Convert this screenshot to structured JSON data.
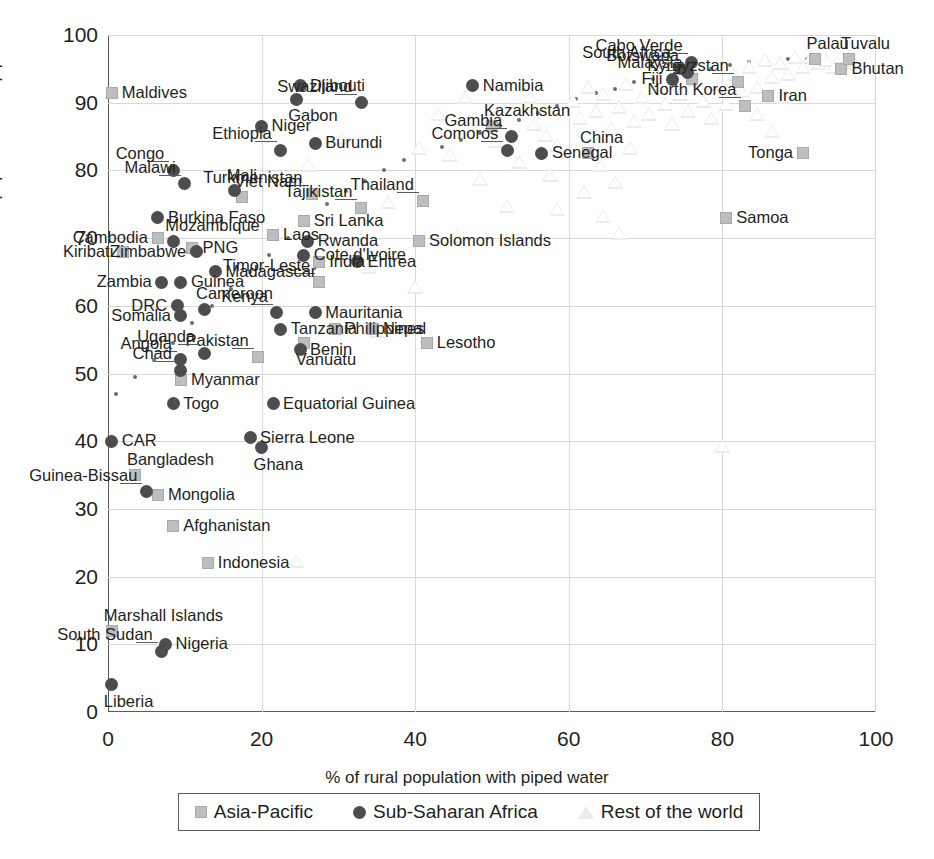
{
  "chart_data": {
    "type": "scatter",
    "title": "",
    "xlabel": "% of rural population with piped water",
    "ylabel": "% of urban population with piped water",
    "xlim": [
      0,
      100
    ],
    "ylim": [
      0,
      100
    ],
    "xticks": [
      0,
      20,
      40,
      60,
      80,
      100
    ],
    "yticks": [
      0,
      10,
      20,
      30,
      40,
      50,
      60,
      70,
      80,
      90,
      100
    ],
    "grid": true,
    "legend_position": "bottom",
    "legend": [
      {
        "label": "Asia-Pacific",
        "marker": "square",
        "color": "#bcbec0"
      },
      {
        "label": "Sub-Saharan Africa",
        "marker": "circle",
        "color": "#4d4d4f"
      },
      {
        "label": "Rest of the world",
        "marker": "triangle",
        "color": "#ececec"
      }
    ],
    "series": [
      {
        "name": "Asia-Pacific",
        "marker": "square",
        "points": [
          {
            "label": "Maldives",
            "x": 0.5,
            "y": 91.5,
            "label_pos": "right"
          },
          {
            "label": "Kiribati",
            "x": 2.0,
            "y": 68.0,
            "label_pos": "left"
          },
          {
            "label": "Cambodia",
            "x": 6.5,
            "y": 70.0,
            "label_pos": "left"
          },
          {
            "label": "PNG",
            "x": 11.0,
            "y": 68.5,
            "label_pos": "right"
          },
          {
            "label": "Viet Nam",
            "x": 17.5,
            "y": 76.0,
            "label_pos": "above"
          },
          {
            "label": "Laos",
            "x": 21.5,
            "y": 70.5,
            "label_pos": "right"
          },
          {
            "label": "Sri Lanka",
            "x": 25.5,
            "y": 72.5,
            "label_pos": "right"
          },
          {
            "label": "Turkmenistan",
            "x": 26.5,
            "y": 76.5,
            "label_pos": "leader"
          },
          {
            "label": "India",
            "x": 27.5,
            "y": 66.5,
            "label_pos": "right"
          },
          {
            "label": "Timor-Leste",
            "x": 27.5,
            "y": 63.5,
            "label_pos": "leader"
          },
          {
            "label": "Tajikistan",
            "x": 33.0,
            "y": 74.5,
            "label_pos": "leader"
          },
          {
            "label": "Philippines",
            "x": 29.5,
            "y": 56.5,
            "label_pos": "right"
          },
          {
            "label": "Myanmar",
            "x": 9.5,
            "y": 49.0,
            "label_pos": "right"
          },
          {
            "label": "Pakistan",
            "x": 19.5,
            "y": 52.5,
            "label_pos": "leader"
          },
          {
            "label": "Vanuatu",
            "x": 25.5,
            "y": 54.5,
            "label_pos": "below"
          },
          {
            "label": "Nepal",
            "x": 34.5,
            "y": 56.5,
            "label_pos": "right"
          },
          {
            "label": "Solomon Islands",
            "x": 40.5,
            "y": 69.5,
            "label_pos": "right"
          },
          {
            "label": "Thailand",
            "x": 41.0,
            "y": 75.5,
            "label_pos": "leader"
          },
          {
            "label": "Lesotho",
            "x": 41.5,
            "y": 54.5,
            "label_pos": "right"
          },
          {
            "label": "Kazakhstan",
            "x": 50.0,
            "y": 86.5,
            "label_pos": "above"
          },
          {
            "label": "China",
            "x": 62.5,
            "y": 82.5,
            "label_pos": "above"
          },
          {
            "label": "Malaysia",
            "x": 76.0,
            "y": 93.5,
            "label_pos": "leader"
          },
          {
            "label": "Kyrgyzstan",
            "x": 82.0,
            "y": 93.0,
            "label_pos": "leader"
          },
          {
            "label": "North Korea",
            "x": 83.0,
            "y": 89.5,
            "label_pos": "leader"
          },
          {
            "label": "Iran",
            "x": 86.0,
            "y": 91.0,
            "label_pos": "right"
          },
          {
            "label": "Tonga",
            "x": 90.5,
            "y": 82.5,
            "label_pos": "left"
          },
          {
            "label": "Samoa",
            "x": 80.5,
            "y": 73.0,
            "label_pos": "right"
          },
          {
            "label": "Bangladesh",
            "x": 3.5,
            "y": 35.0,
            "label_pos": "above"
          },
          {
            "label": "Mongolia",
            "x": 6.5,
            "y": 32.0,
            "label_pos": "right"
          },
          {
            "label": "Afghanistan",
            "x": 8.5,
            "y": 27.5,
            "label_pos": "right"
          },
          {
            "label": "Indonesia",
            "x": 13.0,
            "y": 22.0,
            "label_pos": "right"
          },
          {
            "label": "Marshall Islands",
            "x": 0.5,
            "y": 12.0,
            "label_pos": "above"
          },
          {
            "label": "Bhutan",
            "x": 95.5,
            "y": 95.0,
            "label_pos": "right"
          },
          {
            "label": "Palau",
            "x": 92.0,
            "y": 96.5,
            "label_pos": "above"
          },
          {
            "label": "Tuvalu",
            "x": 96.5,
            "y": 96.5,
            "label_pos": "above"
          }
        ]
      },
      {
        "name": "Sub-Saharan Africa",
        "marker": "circle",
        "points": [
          {
            "label": "Djibouti",
            "x": 25.0,
            "y": 92.5,
            "label_pos": "right"
          },
          {
            "label": "Gabon",
            "x": 24.5,
            "y": 90.5,
            "label_pos": "below"
          },
          {
            "label": "Niger",
            "x": 20.0,
            "y": 86.5,
            "label_pos": "right"
          },
          {
            "label": "Ethiopia",
            "x": 22.5,
            "y": 83.0,
            "label_pos": "leader"
          },
          {
            "label": "Burundi",
            "x": 27.0,
            "y": 84.0,
            "label_pos": "right"
          },
          {
            "label": "Congo",
            "x": 8.5,
            "y": 80.0,
            "label_pos": "leader"
          },
          {
            "label": "Malawi",
            "x": 10.0,
            "y": 78.0,
            "label_pos": "leader"
          },
          {
            "label": "Mali",
            "x": 16.5,
            "y": 77.0,
            "label_pos": "above"
          },
          {
            "label": "Burkina Faso",
            "x": 6.5,
            "y": 73.0,
            "label_pos": "right"
          },
          {
            "label": "Mozambique",
            "x": 8.5,
            "y": 69.5,
            "label_pos": "above"
          },
          {
            "label": "Zimbabwe",
            "x": 11.5,
            "y": 68.0,
            "label_pos": "left"
          },
          {
            "label": "Rwanda",
            "x": 26.0,
            "y": 69.5,
            "label_pos": "right"
          },
          {
            "label": "Cote d'Ivoire",
            "x": 25.5,
            "y": 67.5,
            "label_pos": "right"
          },
          {
            "label": "Madagascar",
            "x": 14.0,
            "y": 65.0,
            "label_pos": "right"
          },
          {
            "label": "Guinea",
            "x": 9.5,
            "y": 63.5,
            "label_pos": "right"
          },
          {
            "label": "Zambia",
            "x": 7.0,
            "y": 63.5,
            "label_pos": "left"
          },
          {
            "label": "DRC",
            "x": 9.0,
            "y": 60.0,
            "label_pos": "left"
          },
          {
            "label": "Cameroon",
            "x": 12.5,
            "y": 59.5,
            "label_pos": "above"
          },
          {
            "label": "Somalia",
            "x": 9.5,
            "y": 58.5,
            "label_pos": "left"
          },
          {
            "label": "Eritrea",
            "x": 32.5,
            "y": 66.5,
            "label_pos": "right"
          },
          {
            "label": "Kenya",
            "x": 22.0,
            "y": 59.0,
            "label_pos": "leader"
          },
          {
            "label": "Tanzania",
            "x": 22.5,
            "y": 56.5,
            "label_pos": "right"
          },
          {
            "label": "Mauritania",
            "x": 27.0,
            "y": 59.0,
            "label_pos": "right"
          },
          {
            "label": "Benin",
            "x": 25.0,
            "y": 53.5,
            "label_pos": "right"
          },
          {
            "label": "Uganda",
            "x": 12.5,
            "y": 53.0,
            "label_pos": "leader"
          },
          {
            "label": "Angola",
            "x": 9.5,
            "y": 52.0,
            "label_pos": "leader"
          },
          {
            "label": "Chad",
            "x": 9.5,
            "y": 50.5,
            "label_pos": "leader"
          },
          {
            "label": "Togo",
            "x": 8.5,
            "y": 45.5,
            "label_pos": "right"
          },
          {
            "label": "Equatorial Guinea",
            "x": 21.5,
            "y": 45.5,
            "label_pos": "right"
          },
          {
            "label": "Sierra Leone",
            "x": 18.5,
            "y": 40.5,
            "label_pos": "right"
          },
          {
            "label": "Ghana",
            "x": 20.0,
            "y": 39.0,
            "label_pos": "below"
          },
          {
            "label": "CAR",
            "x": 0.5,
            "y": 40.0,
            "label_pos": "right"
          },
          {
            "label": "Guinea-Bissau",
            "x": 5.0,
            "y": 32.5,
            "label_pos": "leader"
          },
          {
            "label": "Nigeria",
            "x": 7.5,
            "y": 10.0,
            "label_pos": "right"
          },
          {
            "label": "South Sudan",
            "x": 7.0,
            "y": 9.0,
            "label_pos": "leader"
          },
          {
            "label": "Liberia",
            "x": 0.5,
            "y": 4.0,
            "label_pos": "below"
          },
          {
            "label": "Swaziland",
            "x": 33.0,
            "y": 90.0,
            "label_pos": "leader"
          },
          {
            "label": "Namibia",
            "x": 47.5,
            "y": 92.5,
            "label_pos": "right"
          },
          {
            "label": "Gambia",
            "x": 52.5,
            "y": 85.0,
            "label_pos": "leader"
          },
          {
            "label": "Comoros",
            "x": 52.0,
            "y": 83.0,
            "label_pos": "leader"
          },
          {
            "label": "Senegal",
            "x": 56.5,
            "y": 82.5,
            "label_pos": "right"
          },
          {
            "label": "South Africa",
            "x": 74.5,
            "y": 95.0,
            "label_pos": "leader"
          },
          {
            "label": "Cabo Verde",
            "x": 76.0,
            "y": 96.0,
            "label_pos": "leader"
          },
          {
            "label": "Botswana",
            "x": 75.5,
            "y": 94.5,
            "label_pos": "leader"
          },
          {
            "label": "Fiji",
            "x": 73.5,
            "y": 93.5,
            "label_pos": "left"
          }
        ]
      },
      {
        "name": "Rest of the world",
        "marker": "triangle",
        "points": [
          {
            "x": 29.0,
            "y": 92.5
          },
          {
            "x": 30.5,
            "y": 84.5
          },
          {
            "x": 26.0,
            "y": 80.5
          },
          {
            "x": 19.5,
            "y": 73.0
          },
          {
            "x": 23.0,
            "y": 65.5
          },
          {
            "x": 24.5,
            "y": 22.0
          },
          {
            "x": 34.0,
            "y": 65.5
          },
          {
            "x": 36.5,
            "y": 75.0
          },
          {
            "x": 40.5,
            "y": 83.0
          },
          {
            "x": 43.0,
            "y": 88.0
          },
          {
            "x": 44.5,
            "y": 82.0
          },
          {
            "x": 46.5,
            "y": 90.5
          },
          {
            "x": 48.5,
            "y": 78.5
          },
          {
            "x": 50.5,
            "y": 84.0
          },
          {
            "x": 53.5,
            "y": 81.0
          },
          {
            "x": 55.5,
            "y": 86.5
          },
          {
            "x": 57.5,
            "y": 79.0
          },
          {
            "x": 58.5,
            "y": 83.5
          },
          {
            "x": 60.5,
            "y": 90.0
          },
          {
            "x": 61.5,
            "y": 87.5
          },
          {
            "x": 62.5,
            "y": 92.0
          },
          {
            "x": 63.5,
            "y": 88.5
          },
          {
            "x": 64.5,
            "y": 91.0
          },
          {
            "x": 64.0,
            "y": 80.5
          },
          {
            "x": 65.5,
            "y": 86.0
          },
          {
            "x": 66.5,
            "y": 89.0
          },
          {
            "x": 67.5,
            "y": 92.5
          },
          {
            "x": 66.0,
            "y": 78.0
          },
          {
            "x": 68.5,
            "y": 87.0
          },
          {
            "x": 69.5,
            "y": 90.5
          },
          {
            "x": 70.5,
            "y": 88.0
          },
          {
            "x": 68.0,
            "y": 83.0
          },
          {
            "x": 71.5,
            "y": 92.0
          },
          {
            "x": 72.5,
            "y": 89.5
          },
          {
            "x": 73.5,
            "y": 86.5
          },
          {
            "x": 74.5,
            "y": 91.0
          },
          {
            "x": 75.5,
            "y": 88.5
          },
          {
            "x": 76.5,
            "y": 93.0
          },
          {
            "x": 77.5,
            "y": 90.0
          },
          {
            "x": 78.5,
            "y": 87.5
          },
          {
            "x": 79.5,
            "y": 92.5
          },
          {
            "x": 80.5,
            "y": 89.5
          },
          {
            "x": 81.5,
            "y": 94.0
          },
          {
            "x": 82.5,
            "y": 91.5
          },
          {
            "x": 83.5,
            "y": 95.0
          },
          {
            "x": 84.5,
            "y": 92.0
          },
          {
            "x": 85.5,
            "y": 96.0
          },
          {
            "x": 86.5,
            "y": 93.5
          },
          {
            "x": 87.5,
            "y": 95.5
          },
          {
            "x": 88.5,
            "y": 94.0
          },
          {
            "x": 89.5,
            "y": 96.5
          },
          {
            "x": 90.5,
            "y": 95.0
          },
          {
            "x": 91.5,
            "y": 96.5
          },
          {
            "x": 92.5,
            "y": 95.5
          },
          {
            "x": 93.5,
            "y": 96.0
          },
          {
            "x": 94.5,
            "y": 95.0
          },
          {
            "x": 95.5,
            "y": 96.5
          },
          {
            "x": 96.5,
            "y": 95.5
          },
          {
            "x": 97.0,
            "y": 96.0
          },
          {
            "x": 58.5,
            "y": 74.0
          },
          {
            "x": 62.0,
            "y": 76.5
          },
          {
            "x": 64.5,
            "y": 73.0
          },
          {
            "x": 66.5,
            "y": 70.5
          },
          {
            "x": 80.0,
            "y": 39.0
          },
          {
            "x": 84.5,
            "y": 88.0
          },
          {
            "x": 86.5,
            "y": 85.5
          },
          {
            "x": 88.0,
            "y": 90.5
          },
          {
            "x": 52.0,
            "y": 74.5
          },
          {
            "x": 45.5,
            "y": 70.0
          },
          {
            "x": 40.0,
            "y": 62.5
          },
          {
            "x": 35.0,
            "y": 56.0
          },
          {
            "x": 55.0,
            "y": 90.5
          },
          {
            "x": 50.5,
            "y": 88.0
          },
          {
            "x": 57.0,
            "y": 85.0
          }
        ]
      }
    ],
    "trendline": {
      "style": "dotted",
      "color": "#6d6e71",
      "points": [
        {
          "x": 1.0,
          "y": 47.0
        },
        {
          "x": 3.5,
          "y": 49.5
        },
        {
          "x": 6.0,
          "y": 52.0
        },
        {
          "x": 8.5,
          "y": 54.5
        },
        {
          "x": 11.0,
          "y": 57.5
        },
        {
          "x": 13.5,
          "y": 60.0
        },
        {
          "x": 16.0,
          "y": 62.5
        },
        {
          "x": 18.5,
          "y": 65.0
        },
        {
          "x": 21.0,
          "y": 67.5
        },
        {
          "x": 23.5,
          "y": 70.0
        },
        {
          "x": 26.0,
          "y": 72.5
        },
        {
          "x": 28.5,
          "y": 75.0
        },
        {
          "x": 31.0,
          "y": 77.0
        },
        {
          "x": 33.5,
          "y": 78.5
        },
        {
          "x": 36.0,
          "y": 80.0
        },
        {
          "x": 38.5,
          "y": 81.5
        },
        {
          "x": 41.0,
          "y": 82.5
        },
        {
          "x": 43.5,
          "y": 83.5
        },
        {
          "x": 46.0,
          "y": 84.5
        },
        {
          "x": 48.5,
          "y": 85.5
        },
        {
          "x": 51.0,
          "y": 86.5
        },
        {
          "x": 53.5,
          "y": 87.5
        },
        {
          "x": 56.0,
          "y": 88.5
        },
        {
          "x": 58.5,
          "y": 89.5
        },
        {
          "x": 61.0,
          "y": 90.5
        },
        {
          "x": 63.5,
          "y": 91.5
        },
        {
          "x": 66.0,
          "y": 92.0
        },
        {
          "x": 68.5,
          "y": 93.0
        },
        {
          "x": 71.0,
          "y": 93.5
        },
        {
          "x": 73.5,
          "y": 94.0
        },
        {
          "x": 76.0,
          "y": 94.5
        },
        {
          "x": 78.5,
          "y": 95.0
        },
        {
          "x": 81.0,
          "y": 95.5
        },
        {
          "x": 83.5,
          "y": 96.0
        },
        {
          "x": 86.0,
          "y": 96.0
        },
        {
          "x": 88.5,
          "y": 96.5
        },
        {
          "x": 91.0,
          "y": 96.5
        },
        {
          "x": 93.5,
          "y": 96.5
        },
        {
          "x": 96.0,
          "y": 96.5
        }
      ]
    }
  }
}
